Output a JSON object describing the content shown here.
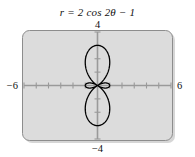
{
  "title": {
    "full": "r = 2 cos 2θ − 1",
    "lhs": "r",
    "equals": "=",
    "coefficient": "2",
    "function": "cos",
    "argument": "2θ",
    "minus": "−",
    "constant": "1"
  },
  "axis_labels": {
    "top": "4",
    "bottom": "−4",
    "left": "−6",
    "right": "6"
  },
  "colors": {
    "plot_background": "#dcdcdc",
    "plot_border": "#8d8d8d",
    "axis": "#9a9a9a",
    "curve": "#000000",
    "text": "#111111",
    "page_background": "#ffffff",
    "shadow": "#b4b4b4"
  },
  "chart_data": {
    "type": "line",
    "title": "r = 2 cos 2θ − 1",
    "plot_style": "polar",
    "equation": "r = 2*cos(2*theta) - 1",
    "xlabel": "",
    "ylabel": "",
    "xlim": [
      -6,
      6
    ],
    "ylim": [
      -4,
      4
    ],
    "xticks": [
      -6,
      -5,
      -4,
      -3,
      -2,
      -1,
      0,
      1,
      2,
      3,
      4,
      5,
      6
    ],
    "yticks": [
      -4,
      -3,
      -2,
      -1,
      0,
      1,
      2,
      3,
      4
    ],
    "tick_interval": 1,
    "grid": false,
    "legend": false,
    "axis_labels_shown": [
      "4",
      "−4",
      "−6",
      "6"
    ],
    "theta_range_deg": [
      0,
      360
    ],
    "series": [
      {
        "name": "r = 2 cos 2θ − 1",
        "color": "#000000",
        "linewidth": 1.3,
        "description": "Limacon-type rose with two large vertical petals reaching r = 3 along theta = 90 and 270 degrees, and two small horizontal petals of radius 1 along theta = 0 and 180 degrees",
        "key_points": [
          {
            "theta_deg": 0,
            "r": 1,
            "x": 1,
            "y": 0
          },
          {
            "theta_deg": 30,
            "r": 0,
            "x": 0,
            "y": 0
          },
          {
            "theta_deg": 45,
            "r": -1,
            "x": -0.707,
            "y": -0.707
          },
          {
            "theta_deg": 60,
            "r": -2,
            "x": -1,
            "y": -1.732
          },
          {
            "theta_deg": 90,
            "r": -3,
            "x": 0,
            "y": -3
          },
          {
            "theta_deg": 120,
            "r": -2,
            "x": 1,
            "y": -1.732
          },
          {
            "theta_deg": 135,
            "r": -1,
            "x": 0.707,
            "y": -0.707
          },
          {
            "theta_deg": 150,
            "r": 0,
            "x": 0,
            "y": 0
          },
          {
            "theta_deg": 180,
            "r": 1,
            "x": -1,
            "y": 0
          },
          {
            "theta_deg": 210,
            "r": 0,
            "x": 0,
            "y": 0
          },
          {
            "theta_deg": 225,
            "r": -1,
            "x": 0.707,
            "y": 0.707
          },
          {
            "theta_deg": 240,
            "r": -2,
            "x": 1,
            "y": 1.732
          },
          {
            "theta_deg": 270,
            "r": -3,
            "x": 0,
            "y": 3
          },
          {
            "theta_deg": 300,
            "r": -2,
            "x": -1,
            "y": 1.732
          },
          {
            "theta_deg": 315,
            "r": -1,
            "x": -0.707,
            "y": 0.707
          },
          {
            "theta_deg": 330,
            "r": 0,
            "x": 0,
            "y": 0
          },
          {
            "theta_deg": 360,
            "r": 1,
            "x": 1,
            "y": 0
          }
        ],
        "extent": {
          "x_min": -1,
          "x_max": 1,
          "y_min": -3,
          "y_max": 3
        }
      }
    ]
  }
}
